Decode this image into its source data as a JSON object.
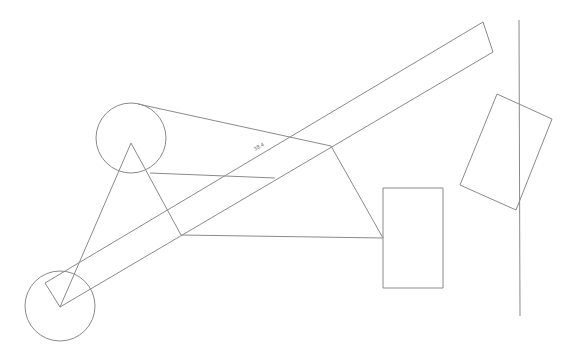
{
  "drawing": {
    "background": "#ffffff",
    "stroke_color": "#8a8a8a",
    "dimension_label": "38.4",
    "circles": [
      {
        "name": "upper-pulley",
        "cx": 131,
        "cy": 138,
        "r": 35
      },
      {
        "name": "lower-pulley",
        "cx": 60,
        "cy": 306,
        "r": 35
      }
    ],
    "polylines": [
      {
        "name": "triangle-link",
        "points": "60,307 131,143 181,235"
      },
      {
        "name": "inclined-bar-upper-edge",
        "points": "45,283 483,22"
      },
      {
        "name": "inclined-bar-lower-edge",
        "points": "60,307 493,52"
      },
      {
        "name": "inclined-bar-end-cap",
        "points": "483,22 493,52"
      },
      {
        "name": "inclined-bar-start-cap",
        "points": "45,283 60,307"
      },
      {
        "name": "quad-linkage",
        "points": "138,104 331,146 383,238 181,235"
      },
      {
        "name": "cross-member",
        "points": "150,173 275,178"
      },
      {
        "name": "vertical-wall",
        "points": "519,20 520,316"
      }
    ],
    "rects": [
      {
        "name": "upright-block",
        "points": "383,188 443,188 443,288 383,288"
      },
      {
        "name": "tilted-block",
        "points": "497,94 552,119 516,210 460,185"
      }
    ]
  }
}
